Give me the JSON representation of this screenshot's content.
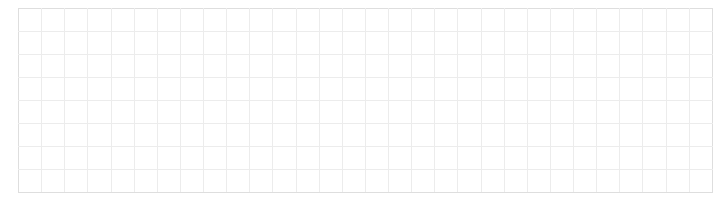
{
  "document": {
    "title": "Empty Grid Sheet",
    "background_color": "#ffffff"
  },
  "grid": {
    "name": "empty-grid",
    "columns": 30,
    "rows": 8,
    "origin_x": 18,
    "origin_y": 8,
    "width": 664,
    "height": 184,
    "cell_width": 22.13,
    "cell_height": 23,
    "line_color": "#e4e4e4",
    "line_color_light": "#ececec",
    "border_color": "#dedede",
    "line_width": 1,
    "cell_text": ""
  }
}
